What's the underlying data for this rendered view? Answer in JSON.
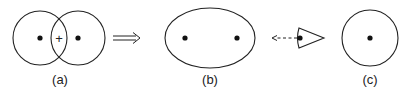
{
  "diagram": {
    "panels": [
      {
        "id": "a",
        "label": "(a)",
        "description": "two overlapping circles, each with a center dot, plus sign in overlap",
        "overlap_symbol": "+"
      },
      {
        "id": "b",
        "label": "(b)",
        "description": "ellipse with two dots"
      },
      {
        "id": "c",
        "label": "(c)",
        "description": "single circle with center dot"
      }
    ],
    "connectors": [
      {
        "type": "double-arrow",
        "from": "a",
        "to": "b",
        "glyph": "⟹"
      },
      {
        "type": "dashed-arrow",
        "direction": "left",
        "source": "eye-cone",
        "description": "viewing direction from cone toward (b)"
      }
    ],
    "colors": {
      "stroke": "#222222",
      "background": "#ffffff"
    }
  }
}
